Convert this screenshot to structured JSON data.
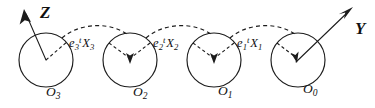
{
  "figure": {
    "background_color": "#ffffff",
    "ink_color": "#1c1c1c",
    "width": 375,
    "height": 108
  },
  "axes": [
    {
      "name": "z-axis",
      "label": "Z",
      "direction": "up-left",
      "anchor_sphere": "O3",
      "style": "solid-arrow"
    },
    {
      "name": "y-axis",
      "label": "Y",
      "direction": "up-right",
      "anchor_sphere": "O0",
      "style": "solid-arrow"
    }
  ],
  "spheres": [
    {
      "id": "O3",
      "label": "O",
      "subscript": "3",
      "cx": 46,
      "cy": 60,
      "r": 27
    },
    {
      "id": "O2",
      "label": "O",
      "subscript": "2",
      "cx": 130,
      "cy": 60,
      "r": 27
    },
    {
      "id": "O1",
      "label": "O",
      "subscript": "1",
      "cx": 214,
      "cy": 60,
      "r": 27
    },
    {
      "id": "O0",
      "label": "O",
      "subscript": "0",
      "cx": 298,
      "cy": 60,
      "r": 27
    }
  ],
  "links": [
    {
      "id": "link3",
      "base": "e",
      "base_sub": "3",
      "base_sup": "t",
      "vector": "X",
      "vector_sub": "3",
      "from": "O3",
      "to": "O2"
    },
    {
      "id": "link2",
      "base": "e",
      "base_sub": "2",
      "base_sup": "t",
      "vector": "X",
      "vector_sub": "2",
      "from": "O2",
      "to": "O1"
    },
    {
      "id": "link1",
      "base": "e",
      "base_sub": "1",
      "base_sup": "t",
      "vector": "X",
      "vector_sub": "1",
      "from": "O1",
      "to": "O0"
    }
  ]
}
